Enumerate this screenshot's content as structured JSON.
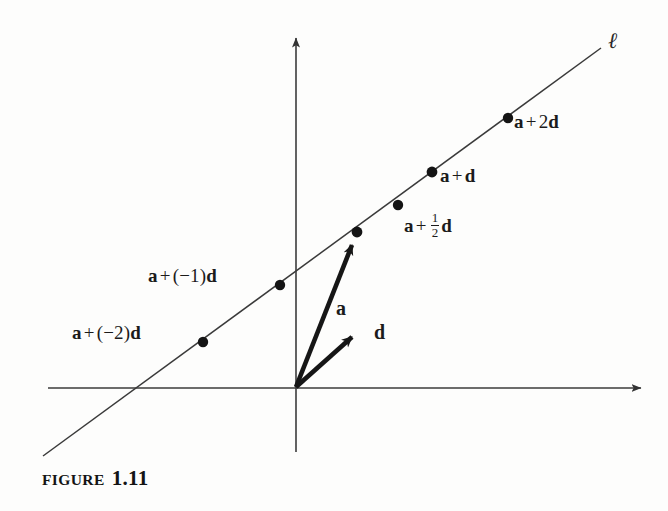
{
  "figure": {
    "caption_word": "FIGURE",
    "caption_number": "1.11",
    "line_label": "ℓ"
  },
  "axes": {
    "x_axis_name": "x-axis",
    "y_axis_name": "y-axis",
    "origin_label": ""
  },
  "vectors": [
    {
      "name": "a",
      "label": "a",
      "from": [
        296,
        387
      ],
      "to": [
        357,
        232
      ]
    },
    {
      "name": "d",
      "label": "d",
      "from": [
        296,
        387
      ],
      "to": [
        360,
        330
      ]
    }
  ],
  "points": [
    {
      "id": "a-minus-2d",
      "prefix": "a",
      "op": "+",
      "coef": "(−2)",
      "suffix": "d",
      "full_label": "a + (−2)d",
      "x": 203,
      "y": 342
    },
    {
      "id": "a-minus-1d",
      "prefix": "a",
      "op": "+",
      "coef": "(−1)",
      "suffix": "d",
      "full_label": "a + (−1)d",
      "x": 280,
      "y": 285
    },
    {
      "id": "a",
      "prefix": "a",
      "op": "",
      "coef": "",
      "suffix": "",
      "full_label": "a",
      "x": 357,
      "y": 232
    },
    {
      "id": "a-plus-half-d",
      "prefix": "a",
      "op": "+",
      "coef": "1/2",
      "suffix": "d",
      "full_label": "a + 1/2 d",
      "x": 398,
      "y": 205
    },
    {
      "id": "a-plus-d",
      "prefix": "a",
      "op": "+",
      "coef": "",
      "suffix": "d",
      "full_label": "a + d",
      "x": 432,
      "y": 172
    },
    {
      "id": "a-plus-2d",
      "prefix": "a",
      "op": "+",
      "coef": "2",
      "suffix": "d",
      "full_label": "a + 2d",
      "x": 508,
      "y": 118
    }
  ],
  "labels": {
    "a_minus_2d": {
      "a": "a",
      "plus": "+",
      "coef": "(−2)",
      "d": "d"
    },
    "a_minus_1d": {
      "a": "a",
      "plus": "+",
      "coef": "(−1)",
      "d": "d"
    },
    "a_half_d": {
      "a": "a",
      "plus": "+",
      "num": "1",
      "den": "2",
      "d": "d"
    },
    "a_plus_d": {
      "a": "a",
      "plus": "+",
      "d": "d"
    },
    "a_plus_2d": {
      "a": "a",
      "plus": "+",
      "coef": "2",
      "d": "d"
    },
    "vector_a": "a",
    "vector_d": "d"
  },
  "colors": {
    "ink": "#1b1b1b",
    "axis": "#3b3b3b",
    "line": "#3a3a3a",
    "background": "#fdfdfc"
  }
}
